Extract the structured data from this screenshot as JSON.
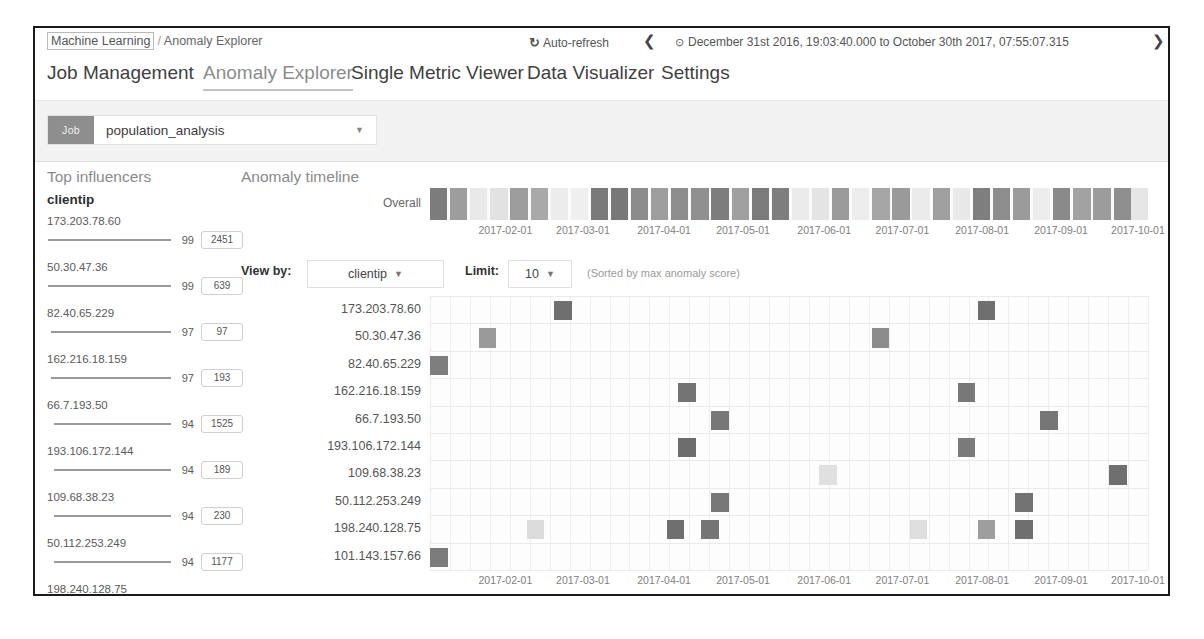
{
  "header": {
    "breadcrumb_root": "Machine Learning",
    "breadcrumb_sep": "/",
    "breadcrumb_current": "Anomaly Explorer",
    "auto_refresh_label": "Auto-refresh",
    "auto_refresh_icon": "refresh-icon",
    "prev_icon": "❮",
    "next_icon": "❯",
    "clock_icon": "⊙",
    "date_range": "December 31st 2016, 19:03:40.000 to October 30th 2017, 07:55:07.315"
  },
  "tabs": [
    {
      "label": "Job Management",
      "active": false,
      "left": 12
    },
    {
      "label": "Anomaly Explorer",
      "active": true,
      "left": 168
    },
    {
      "label": "Single Metric Viewer",
      "active": false,
      "left": 316
    },
    {
      "label": "Data Visualizer",
      "active": false,
      "left": 492
    },
    {
      "label": "Settings",
      "active": false,
      "left": 626
    }
  ],
  "job_selector": {
    "badge": "Job",
    "value": "population_analysis",
    "caret": "▼"
  },
  "influencers": {
    "title": "Top influencers",
    "field": "clientip",
    "items": [
      {
        "name": "173.203.78.60",
        "score": "99",
        "count": "2451",
        "bar_pct": 99
      },
      {
        "name": "50.30.47.36",
        "score": "99",
        "count": "639",
        "bar_pct": 99
      },
      {
        "name": "82.40.65.229",
        "score": "97",
        "count": "97",
        "bar_pct": 97
      },
      {
        "name": "162.216.18.159",
        "score": "97",
        "count": "193",
        "bar_pct": 97
      },
      {
        "name": "66.7.193.50",
        "score": "94",
        "count": "1525",
        "bar_pct": 94
      },
      {
        "name": "193.106.172.144",
        "score": "94",
        "count": "189",
        "bar_pct": 94
      },
      {
        "name": "109.68.38.23",
        "score": "94",
        "count": "230",
        "bar_pct": 94
      },
      {
        "name": "50.112.253.249",
        "score": "94",
        "count": "1177",
        "bar_pct": 94
      },
      {
        "name": "198.240.128.75",
        "score": "94",
        "count": "336",
        "bar_pct": 94
      }
    ]
  },
  "timeline": {
    "title": "Anomaly timeline",
    "overall_label": "Overall"
  },
  "controls": {
    "view_by_label": "View by:",
    "view_by_value": "clientip",
    "limit_label": "Limit:",
    "limit_value": "10",
    "caret": "▼",
    "sort_note": "(Sorted by max anomaly score)"
  },
  "chart_data": {
    "type": "heatmap",
    "title": "Anomaly timeline",
    "xlabel": "",
    "ylabel": "clientip",
    "x_ticks": [
      "2017-02-01",
      "2017-03-01",
      "2017-04-01",
      "2017-05-01",
      "2017-06-01",
      "2017-07-01",
      "2017-08-01",
      "2017-09-01",
      "2017-10-01"
    ],
    "x_tick_pct": [
      10.5,
      21.3,
      32.6,
      43.6,
      54.9,
      65.8,
      76.9,
      87.9,
      98.6
    ],
    "color_scale": [
      {
        "label": "none",
        "hex": "#f7f7f7"
      },
      {
        "label": "low",
        "hex": "#e4e4e4"
      },
      {
        "label": "warning",
        "hex": "#c9c9c9"
      },
      {
        "label": "minor",
        "hex": "#a8a8a8"
      },
      {
        "label": "major",
        "hex": "#8a8a8a"
      },
      {
        "label": "critical",
        "hex": "#6f6f6f"
      }
    ],
    "overall_lane": {
      "name": "Overall",
      "cells": [
        {
          "x_pct": 0.0,
          "w_pct": 2.4,
          "hex": "#7c7c7c"
        },
        {
          "x_pct": 2.8,
          "w_pct": 2.4,
          "hex": "#9d9d9d"
        },
        {
          "x_pct": 5.6,
          "w_pct": 2.4,
          "hex": "#e9e9e9"
        },
        {
          "x_pct": 8.4,
          "w_pct": 2.4,
          "hex": "#dededede"
        },
        {
          "x_pct": 11.2,
          "w_pct": 2.4,
          "hex": "#9d9d9d"
        },
        {
          "x_pct": 14.0,
          "w_pct": 2.4,
          "hex": "#a9a9a9"
        },
        {
          "x_pct": 16.8,
          "w_pct": 2.4,
          "hex": "#ececec"
        },
        {
          "x_pct": 19.6,
          "w_pct": 2.4,
          "hex": "#efefef"
        },
        {
          "x_pct": 22.4,
          "w_pct": 2.4,
          "hex": "#7a7a7a"
        },
        {
          "x_pct": 25.2,
          "w_pct": 2.4,
          "hex": "#787878"
        },
        {
          "x_pct": 28.0,
          "w_pct": 2.4,
          "hex": "#8c8c8c"
        },
        {
          "x_pct": 30.8,
          "w_pct": 2.4,
          "hex": "#9e9e9e"
        },
        {
          "x_pct": 33.6,
          "w_pct": 2.4,
          "hex": "#8d8d8d"
        },
        {
          "x_pct": 36.4,
          "w_pct": 2.4,
          "hex": "#909090"
        },
        {
          "x_pct": 39.2,
          "w_pct": 2.4,
          "hex": "#7d7d7d"
        },
        {
          "x_pct": 42.0,
          "w_pct": 2.4,
          "hex": "#a0a0a0"
        },
        {
          "x_pct": 44.8,
          "w_pct": 2.4,
          "hex": "#7b7b7b"
        },
        {
          "x_pct": 47.6,
          "w_pct": 2.4,
          "hex": "#7e7e7e"
        },
        {
          "x_pct": 50.4,
          "w_pct": 2.4,
          "hex": "#ebebeb"
        },
        {
          "x_pct": 53.2,
          "w_pct": 2.4,
          "hex": "#e4e4e4"
        },
        {
          "x_pct": 56.0,
          "w_pct": 2.4,
          "hex": "#9b9b9b"
        },
        {
          "x_pct": 58.8,
          "w_pct": 2.4,
          "hex": "#ededed"
        },
        {
          "x_pct": 61.6,
          "w_pct": 2.4,
          "hex": "#a6a6a6"
        },
        {
          "x_pct": 64.4,
          "w_pct": 2.4,
          "hex": "#9a9a9a"
        },
        {
          "x_pct": 67.2,
          "w_pct": 2.4,
          "hex": "#ebebeb"
        },
        {
          "x_pct": 70.0,
          "w_pct": 2.4,
          "hex": "#9f9f9f"
        },
        {
          "x_pct": 72.8,
          "w_pct": 2.4,
          "hex": "#e8e8e8"
        },
        {
          "x_pct": 75.6,
          "w_pct": 2.4,
          "hex": "#7e7e7e"
        },
        {
          "x_pct": 78.4,
          "w_pct": 2.4,
          "hex": "#8d8d8d"
        },
        {
          "x_pct": 81.2,
          "w_pct": 2.4,
          "hex": "#9b9b9b"
        },
        {
          "x_pct": 84.0,
          "w_pct": 2.4,
          "hex": "#ededed"
        },
        {
          "x_pct": 86.8,
          "w_pct": 2.4,
          "hex": "#8a8a8a"
        },
        {
          "x_pct": 89.6,
          "w_pct": 2.4,
          "hex": "#a2a2a2"
        },
        {
          "x_pct": 92.4,
          "w_pct": 2.4,
          "hex": "#9c9c9c"
        },
        {
          "x_pct": 95.2,
          "w_pct": 2.4,
          "hex": "#8f8f8f"
        },
        {
          "x_pct": 97.6,
          "w_pct": 2.4,
          "hex": "#e6e6e6"
        }
      ]
    },
    "rows": [
      {
        "name": "173.203.78.60",
        "cells": [
          {
            "x_pct": 17.3,
            "hex": "#6f6f6f"
          },
          {
            "x_pct": 76.3,
            "hex": "#6f6f6f"
          }
        ]
      },
      {
        "name": "50.30.47.36",
        "cells": [
          {
            "x_pct": 6.8,
            "hex": "#9a9a9a"
          },
          {
            "x_pct": 61.5,
            "hex": "#8c8c8c"
          }
        ]
      },
      {
        "name": "82.40.65.229",
        "cells": [
          {
            "x_pct": 0.0,
            "hex": "#7e7e7e"
          }
        ]
      },
      {
        "name": "162.216.18.159",
        "cells": [
          {
            "x_pct": 34.6,
            "hex": "#747474"
          },
          {
            "x_pct": 73.5,
            "hex": "#787878"
          }
        ]
      },
      {
        "name": "66.7.193.50",
        "cells": [
          {
            "x_pct": 39.2,
            "hex": "#777777"
          },
          {
            "x_pct": 85.0,
            "hex": "#767676"
          }
        ]
      },
      {
        "name": "193.106.172.144",
        "cells": [
          {
            "x_pct": 34.6,
            "hex": "#6d6d6d"
          },
          {
            "x_pct": 73.5,
            "hex": "#7a7a7a"
          }
        ]
      },
      {
        "name": "109.68.38.23",
        "cells": [
          {
            "x_pct": 54.2,
            "hex": "#e0e0e0"
          },
          {
            "x_pct": 94.6,
            "hex": "#6f6f6f"
          }
        ]
      },
      {
        "name": "50.112.253.249",
        "cells": [
          {
            "x_pct": 39.2,
            "hex": "#787878"
          },
          {
            "x_pct": 81.5,
            "hex": "#727272"
          }
        ]
      },
      {
        "name": "198.240.128.75",
        "cells": [
          {
            "x_pct": 13.5,
            "hex": "#dcdcdc"
          },
          {
            "x_pct": 33.0,
            "hex": "#6f6f6f"
          },
          {
            "x_pct": 37.8,
            "hex": "#757575"
          },
          {
            "x_pct": 66.8,
            "hex": "#dedede"
          },
          {
            "x_pct": 76.3,
            "hex": "#9e9e9e"
          },
          {
            "x_pct": 81.5,
            "hex": "#6f6f6f"
          }
        ]
      },
      {
        "name": "101.143.157.66",
        "cells": [
          {
            "x_pct": 0.0,
            "hex": "#7b7b7b"
          }
        ]
      }
    ]
  }
}
